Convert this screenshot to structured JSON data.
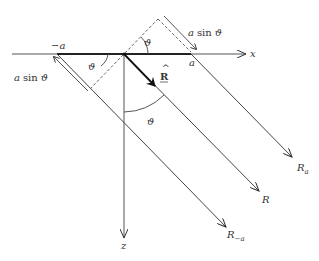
{
  "diagram": {
    "axes": {
      "x_label": "x",
      "z_label": "z"
    },
    "points": {
      "minus_a": "−a",
      "a": "a"
    },
    "rays": [
      {
        "id": "R_a",
        "label_main": "R",
        "label_sub": "a"
      },
      {
        "id": "R",
        "label_main": "R",
        "label_sub": ""
      },
      {
        "id": "R_minus_a",
        "label_main": "R",
        "label_sub": "−a"
      }
    ],
    "unit_vector": {
      "label": "R",
      "accent": "hat"
    },
    "angles": {
      "theta": "ϑ"
    },
    "path_differences": {
      "left": {
        "a": "a",
        "sin": "sin",
        "theta": "ϑ"
      },
      "right": {
        "a": "a",
        "sin": "sin",
        "theta": "ϑ"
      }
    },
    "colors": {
      "line": "#333333",
      "background": "#ffffff"
    }
  }
}
